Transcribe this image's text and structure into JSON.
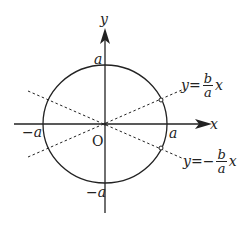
{
  "diagram": {
    "axes": {
      "x_label": "x",
      "y_label": "y",
      "origin_label": "O"
    },
    "ticks": {
      "x_pos": "a",
      "x_neg": "−a",
      "y_pos": "a",
      "y_neg": "−a"
    },
    "asymptotes": [
      {
        "lhs": "y=",
        "sign": "",
        "num": "b",
        "den": "a",
        "var": "x"
      },
      {
        "lhs": "y=",
        "sign": "−",
        "num": "b",
        "den": "a",
        "var": "x"
      }
    ],
    "colors": {
      "stroke": "#222222",
      "background": "#ffffff"
    }
  }
}
